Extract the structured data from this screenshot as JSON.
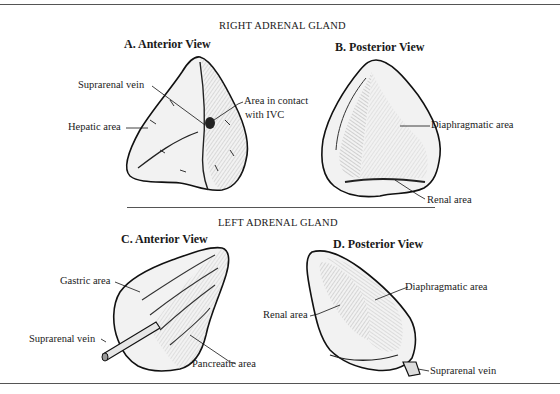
{
  "figure": {
    "sections": [
      {
        "title": "RIGHT ADRENAL GLAND",
        "views": [
          {
            "title": "A. Anterior View",
            "labels": [
              "Suprarenal vein",
              "Hepatic area",
              "Area in contact",
              "with IVC"
            ]
          },
          {
            "title": "B. Posterior View",
            "labels": [
              "Diaphragmatic area",
              "Renal area"
            ]
          }
        ]
      },
      {
        "title": "LEFT ADRENAL GLAND",
        "views": [
          {
            "title": "C. Anterior View",
            "labels": [
              "Gastric area",
              "Suprarenal vein",
              "Pancreatic area"
            ]
          },
          {
            "title": "D. Posterior View",
            "labels": [
              "Diaphragmatic area",
              "Renal area",
              "Suprarenal vein"
            ]
          }
        ]
      }
    ],
    "colors": {
      "ink": "#1a1a1a",
      "shade": "#bdbdbd",
      "paper": "#ffffff"
    }
  }
}
